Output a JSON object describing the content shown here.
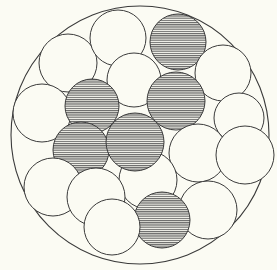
{
  "diagram": {
    "type": "circle-packing",
    "background": "#fbfbf3",
    "stroke_color": "#3a3a3a",
    "hatch_color": "#5a5a5a",
    "container": {
      "cx": 140,
      "cy": 135,
      "r": 129
    },
    "circles": [
      {
        "id": 1,
        "cx": 68,
        "cy": 63,
        "r": 29,
        "hatched": false
      },
      {
        "id": 2,
        "cx": 118,
        "cy": 38,
        "r": 28,
        "hatched": false
      },
      {
        "id": 3,
        "cx": 178,
        "cy": 42,
        "r": 28,
        "hatched": true
      },
      {
        "id": 4,
        "cx": 223,
        "cy": 73,
        "r": 28,
        "hatched": false
      },
      {
        "id": 5,
        "cx": 134,
        "cy": 80,
        "r": 27,
        "hatched": false
      },
      {
        "id": 6,
        "cx": 42,
        "cy": 113,
        "r": 29,
        "hatched": false
      },
      {
        "id": 7,
        "cx": 92,
        "cy": 106,
        "r": 27,
        "hatched": true
      },
      {
        "id": 8,
        "cx": 176,
        "cy": 101,
        "r": 29,
        "hatched": true
      },
      {
        "id": 9,
        "cx": 239,
        "cy": 118,
        "r": 25,
        "hatched": false
      },
      {
        "id": 10,
        "cx": 81,
        "cy": 150,
        "r": 28,
        "hatched": true
      },
      {
        "id": 11,
        "cx": 198,
        "cy": 153,
        "r": 29,
        "hatched": false
      },
      {
        "id": 12,
        "cx": 245,
        "cy": 155,
        "r": 29,
        "hatched": false
      },
      {
        "id": 13,
        "cx": 148,
        "cy": 180,
        "r": 29,
        "hatched": false
      },
      {
        "id": 14,
        "cx": 135,
        "cy": 142,
        "r": 29,
        "hatched": true
      },
      {
        "id": 15,
        "cx": 53,
        "cy": 187,
        "r": 29,
        "hatched": false
      },
      {
        "id": 16,
        "cx": 96,
        "cy": 197,
        "r": 29,
        "hatched": false
      },
      {
        "id": 17,
        "cx": 208,
        "cy": 210,
        "r": 29,
        "hatched": false
      },
      {
        "id": 18,
        "cx": 162,
        "cy": 220,
        "r": 28,
        "hatched": true
      },
      {
        "id": 19,
        "cx": 112,
        "cy": 227,
        "r": 28,
        "hatched": false
      }
    ],
    "counts": {
      "total_inner_circles": 19,
      "hatched": 7,
      "plain": 12
    }
  }
}
